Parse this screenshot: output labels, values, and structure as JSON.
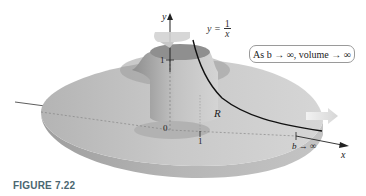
{
  "figure": {
    "caption": "FIGURE 7.22",
    "curve_label": {
      "lhs": "y =",
      "numerator": "1",
      "denominator": "x"
    },
    "annotation": "As b → ∞, volume → ∞",
    "axes": {
      "y_label": "y",
      "x_label": "x",
      "origin_label": "0",
      "y_tick_label": "1",
      "x_tick_label": "1",
      "b_label": "b → ∞"
    },
    "region_label": "R",
    "colors": {
      "disk_top": "#c9c9c9",
      "disk_side": "#a8a8a8",
      "curve": "#111111",
      "caption": "#4a6670",
      "rotation_arrow": "#d0d0d0",
      "direction_arrow": "#e0e0e0"
    }
  }
}
